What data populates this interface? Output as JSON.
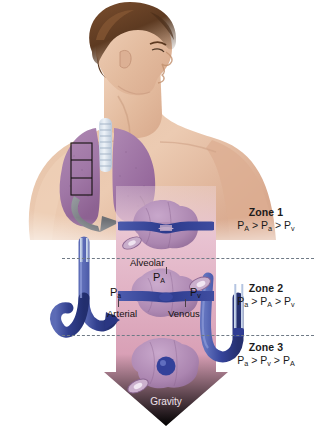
{
  "figure": {
    "background_color": "#ffffff",
    "width": 316,
    "height": 432
  },
  "palette": {
    "gravity_arrow": "#d9a0b6",
    "gravity_arrow_dark": "#c07f9b",
    "band_pink": "#e8bfcd",
    "lung_purple": "#a87fa8",
    "vessel_blue": "#3b4a9c",
    "vessel_blue_light": "#7f92d4",
    "manometer_blue": "#b9cbe8",
    "skin": "#e8c0a4",
    "hair_brown": "#6b4228",
    "divider_gray": "#6f7a86",
    "text_dark": "#1b1b1b",
    "gray_arrow": "#7a7d82"
  },
  "zones": [
    {
      "id": "zone-1",
      "title": "Zone 1",
      "equation": "PA > Pa > Pv",
      "equation_parts": [
        {
          "base": "P",
          "sub": "A"
        },
        {
          "op": ">"
        },
        {
          "base": "P",
          "sub": "a"
        },
        {
          "op": ">"
        },
        {
          "base": "P",
          "sub": "v"
        }
      ],
      "capillary_state": "collapsed"
    },
    {
      "id": "zone-2",
      "title": "Zone 2",
      "equation": "Pa > PA > Pv",
      "equation_parts": [
        {
          "base": "P",
          "sub": "a"
        },
        {
          "op": ">"
        },
        {
          "base": "P",
          "sub": "A"
        },
        {
          "op": ">"
        },
        {
          "base": "P",
          "sub": "v"
        }
      ],
      "capillary_state": "partially-open"
    },
    {
      "id": "zone-3",
      "title": "Zone 3",
      "equation": "Pa > Pv > PA",
      "equation_parts": [
        {
          "base": "P",
          "sub": "a"
        },
        {
          "op": ">"
        },
        {
          "base": "P",
          "sub": "v"
        },
        {
          "op": ">"
        },
        {
          "base": "P",
          "sub": "A"
        }
      ],
      "capillary_state": "distended"
    }
  ],
  "callouts": {
    "alveolar": "Alveolar",
    "alveolar_pressure": {
      "base": "P",
      "sub": "A"
    },
    "arterial_pressure": {
      "base": "P",
      "sub": "a"
    },
    "venous_pressure": {
      "base": "P",
      "sub": "v"
    },
    "arterial": "Arterial",
    "venous": "Venous",
    "gravity": "Gravity"
  },
  "illustration": {
    "torso": "man-torso-lateral-with-lungs",
    "lung_inset_box": "three-segment-rectangle-on-left-lung",
    "pointer_arrow": "gray-curved-arrow",
    "vessels": {
      "left": "arterial-limb-hooked-down",
      "right": "venous-limb-u-shaped"
    },
    "manometers": [
      "left-pair-thin-tubes",
      "right-pair-thin-tubes"
    ]
  }
}
